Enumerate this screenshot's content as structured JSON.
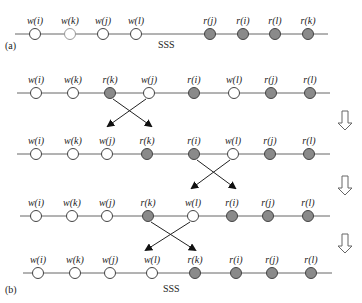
{
  "diagram": {
    "panel_a_label": "(a)",
    "panel_b_label": "(b)",
    "sss_label_a": "SSS",
    "sss_label_b": "SSS",
    "colors": {
      "write_node": "#ffffff",
      "read_node": "#8a8a8a",
      "line": "#666666"
    },
    "rows": [
      {
        "id": "a",
        "y": 34,
        "x_start": 15,
        "x_end": 328,
        "nodes": [
          {
            "label": "w(i)",
            "type": "write",
            "x": 35
          },
          {
            "label": "w(k)",
            "type": "write-light",
            "x": 70
          },
          {
            "label": "w(j)",
            "type": "write",
            "x": 103
          },
          {
            "label": "w(l)",
            "type": "write",
            "x": 136
          },
          {
            "label": "r(j)",
            "type": "read",
            "x": 210
          },
          {
            "label": "r(i)",
            "type": "read",
            "x": 243
          },
          {
            "label": "r(l)",
            "type": "read",
            "x": 275
          },
          {
            "label": "r(k)",
            "type": "read",
            "x": 308
          }
        ]
      },
      {
        "id": "b1",
        "y": 93,
        "x_start": 17,
        "x_end": 330,
        "nodes": [
          {
            "label": "w(i)",
            "type": "write",
            "x": 36
          },
          {
            "label": "w(k)",
            "type": "write",
            "x": 73
          },
          {
            "label": "r(k)",
            "type": "read",
            "x": 110
          },
          {
            "label": "w(j)",
            "type": "write",
            "x": 149
          },
          {
            "label": "r(i)",
            "type": "read",
            "x": 194
          },
          {
            "label": "w(l)",
            "type": "write",
            "x": 234
          },
          {
            "label": "r(j)",
            "type": "read",
            "x": 271
          },
          {
            "label": "r(l)",
            "type": "read",
            "x": 310
          }
        ]
      },
      {
        "id": "b2",
        "y": 154,
        "x_start": 17,
        "x_end": 330,
        "nodes": [
          {
            "label": "w(i)",
            "type": "write",
            "x": 36
          },
          {
            "label": "w(k)",
            "type": "write",
            "x": 73
          },
          {
            "label": "w(j)",
            "type": "write",
            "x": 107
          },
          {
            "label": "r(k)",
            "type": "read",
            "x": 147
          },
          {
            "label": "r(i)",
            "type": "read",
            "x": 194
          },
          {
            "label": "w(l)",
            "type": "write",
            "x": 233
          },
          {
            "label": "r(j)",
            "type": "read",
            "x": 270
          },
          {
            "label": "r(l)",
            "type": "read",
            "x": 309
          }
        ]
      },
      {
        "id": "b3",
        "y": 216,
        "x_start": 20,
        "x_end": 330,
        "nodes": [
          {
            "label": "w(i)",
            "type": "write",
            "x": 36
          },
          {
            "label": "w(k)",
            "type": "write",
            "x": 72
          },
          {
            "label": "w(j)",
            "type": "write",
            "x": 107
          },
          {
            "label": "r(k)",
            "type": "read",
            "x": 148
          },
          {
            "label": "w(l)",
            "type": "write",
            "x": 193
          },
          {
            "label": "r(i)",
            "type": "read",
            "x": 232
          },
          {
            "label": "r(j)",
            "type": "read",
            "x": 268
          },
          {
            "label": "r(l)",
            "type": "read",
            "x": 308
          }
        ]
      },
      {
        "id": "b4",
        "y": 273,
        "x_start": 23,
        "x_end": 332,
        "nodes": [
          {
            "label": "w(i)",
            "type": "write",
            "x": 38
          },
          {
            "label": "w(k)",
            "type": "write",
            "x": 75
          },
          {
            "label": "w(j)",
            "type": "write",
            "x": 110
          },
          {
            "label": "w(l)",
            "type": "write",
            "x": 152
          },
          {
            "label": "r(k)",
            "type": "read",
            "x": 195
          },
          {
            "label": "r(i)",
            "type": "read",
            "x": 236
          },
          {
            "label": "r(j)",
            "type": "read",
            "x": 272
          },
          {
            "label": "r(l)",
            "type": "read",
            "x": 311
          }
        ]
      }
    ],
    "swaps": [
      {
        "from_row": "b1",
        "x1": 110,
        "x2": 149,
        "y_top": 99,
        "y_bot": 126
      },
      {
        "from_row": "b2",
        "x1": 194,
        "x2": 233,
        "y_top": 160,
        "y_bot": 188
      },
      {
        "from_row": "b3",
        "x1": 148,
        "x2": 193,
        "y_top": 222,
        "y_bot": 250
      }
    ],
    "step_arrows": [
      {
        "x": 345,
        "y": 111
      },
      {
        "x": 345,
        "y": 176
      },
      {
        "x": 345,
        "y": 234
      }
    ]
  }
}
